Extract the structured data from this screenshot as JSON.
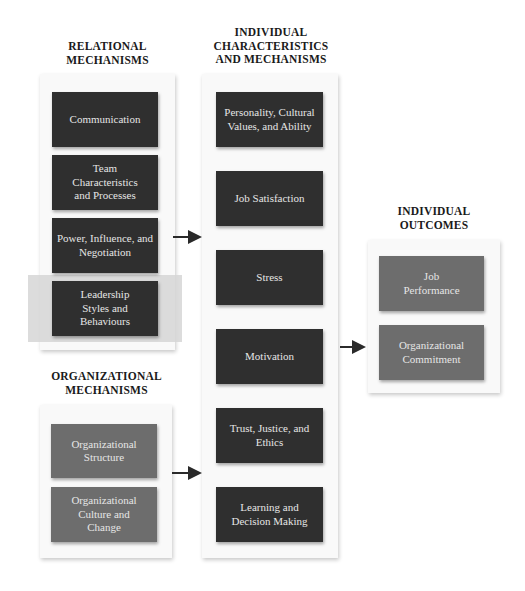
{
  "headings": {
    "relational": "RELATIONAL MECHANISMS",
    "individual": "INDIVIDUAL CHARACTERISTICS AND MECHANISMS",
    "organizational": "ORGANIZATIONAL MECHANISMS",
    "outcomes": "INDIVIDUAL OUTCOMES"
  },
  "heading_lines": {
    "relational": [
      "RELATIONAL",
      "MECHANISMS"
    ],
    "individual": [
      "INDIVIDUAL",
      "CHARACTERISTICS",
      "AND MECHANISMS"
    ],
    "organizational": [
      "ORGANIZATIONAL",
      "MECHANISMS"
    ],
    "outcomes": [
      "INDIVIDUAL",
      "OUTCOMES"
    ]
  },
  "relational": {
    "items": [
      {
        "label": "Communication"
      },
      {
        "label": "Team Characteristics and Processes"
      },
      {
        "label": "Power, Influence, and Negotiation"
      },
      {
        "label": "Leadership Styles and Behaviours",
        "highlighted": true
      }
    ]
  },
  "organizational": {
    "items": [
      {
        "label": "Organizational Structure"
      },
      {
        "label": "Organizational Culture and Change"
      }
    ]
  },
  "individual": {
    "items": [
      {
        "label": "Personality, Cultural Values, and Ability"
      },
      {
        "label": "Job Satisfaction"
      },
      {
        "label": "Stress"
      },
      {
        "label": "Motivation"
      },
      {
        "label": "Trust, Justice, and Ethics"
      },
      {
        "label": "Learning and Decision Making"
      }
    ]
  },
  "outcomes": {
    "items": [
      {
        "label": "Job Performance"
      },
      {
        "label": "Organizational Commitment"
      }
    ]
  },
  "colors": {
    "mechanism_box": "#2f2f2f",
    "context_box": "#6d6d6d",
    "highlight": "#d6d6d6",
    "arrow": "#2a2a2a"
  }
}
